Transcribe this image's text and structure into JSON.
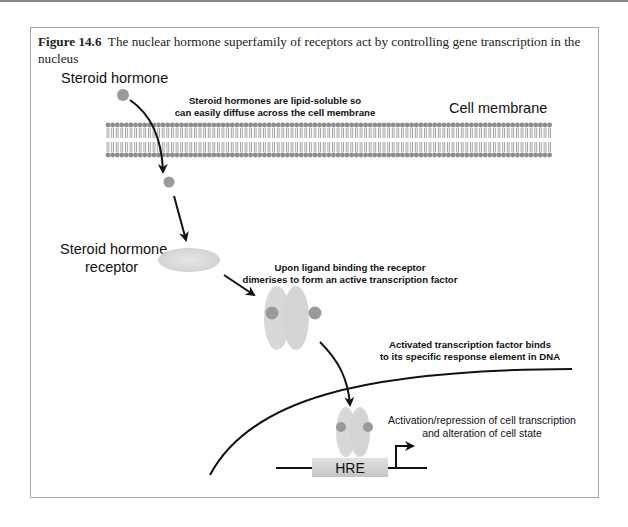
{
  "caption": {
    "figure_label": "Figure 14.6",
    "text": "The nuclear hormone superfamily of receptors act by controlling gene transcription in the nucleus"
  },
  "labels": {
    "steroid_hormone": "Steroid hormone",
    "cell_membrane": "Cell membrane",
    "diffuse_line1": "Steroid hormones are lipid-soluble so",
    "diffuse_line2": "can easily diffuse across the cell membrane",
    "receptor_line1": "Steroid hormone",
    "receptor_line2": "receptor",
    "dimer_line1": "Upon ligand binding the receptor",
    "dimer_line2": "dimerises to form an active transcription factor",
    "binds_line1": "Activated transcription factor binds",
    "binds_line2": "to its specific response element in DNA",
    "hre": "HRE",
    "effect_line1": "Activation/repression of cell transcription",
    "effect_line2": "and alteration of cell state"
  },
  "colors": {
    "hormone": "#9a9a9a",
    "receptor": "#d6d6d6",
    "membrane": "#8c8c8c",
    "arrow": "#111111"
  }
}
